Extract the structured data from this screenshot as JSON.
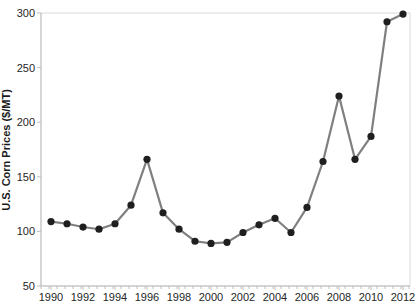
{
  "chart_data": {
    "type": "line",
    "title": "",
    "xlabel": "",
    "ylabel": "U.S. Corn Prices ($/MT)",
    "x": [
      1990,
      1991,
      1992,
      1993,
      1994,
      1995,
      1996,
      1997,
      1998,
      1999,
      2000,
      2001,
      2002,
      2003,
      2004,
      2005,
      2006,
      2007,
      2008,
      2009,
      2010,
      2011,
      2012
    ],
    "values": [
      109,
      107,
      104,
      102,
      107,
      124,
      166,
      117,
      102,
      91,
      89,
      90,
      99,
      106,
      112,
      99,
      122,
      164,
      224,
      166,
      187,
      292,
      299
    ],
    "series_name": "U.S. corn price",
    "ylim": [
      50,
      300
    ],
    "yticks": [
      50,
      100,
      150,
      200,
      250,
      300
    ],
    "xticks": [
      1990,
      1992,
      1994,
      1996,
      1998,
      2000,
      2002,
      2004,
      2006,
      2008,
      2010,
      2012
    ],
    "grid": "off",
    "legend": "none",
    "colors": {
      "line": "#7f7f7f",
      "marker": "#1f1f1f",
      "axis": "#bfbfbf",
      "plot_border": "#d9d9d9",
      "tick_label": "#262626"
    }
  }
}
